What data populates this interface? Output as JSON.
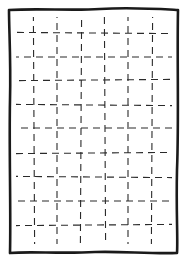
{
  "sketch": {
    "description": "hand-drawn rectangle with dashed grid",
    "width": 187,
    "height": 262,
    "stroke_color": "#1a1a1a",
    "grid_color": "#2a2a2a",
    "frame": {
      "path": "M9,10 C40,8 70,11 100,9 C130,7 160,9 178,10 C177,60 179,120 177,170 C176,210 178,240 177,253 C150,254 120,251 95,252 C60,254 30,251 10,253 C11,210 9,150 10,100 C11,60 9,30 9,10 Z",
      "stroke_width": 2.6
    },
    "grid": {
      "x_min": 14,
      "x_max": 174,
      "y_min": 14,
      "y_max": 250,
      "vertical_x": [
        34,
        57,
        81,
        105,
        128,
        152
      ],
      "horizontal_y": [
        33,
        57,
        80,
        105,
        128,
        153,
        177,
        201,
        225
      ],
      "dash": "7 5",
      "stroke_width": 1.1
    }
  }
}
